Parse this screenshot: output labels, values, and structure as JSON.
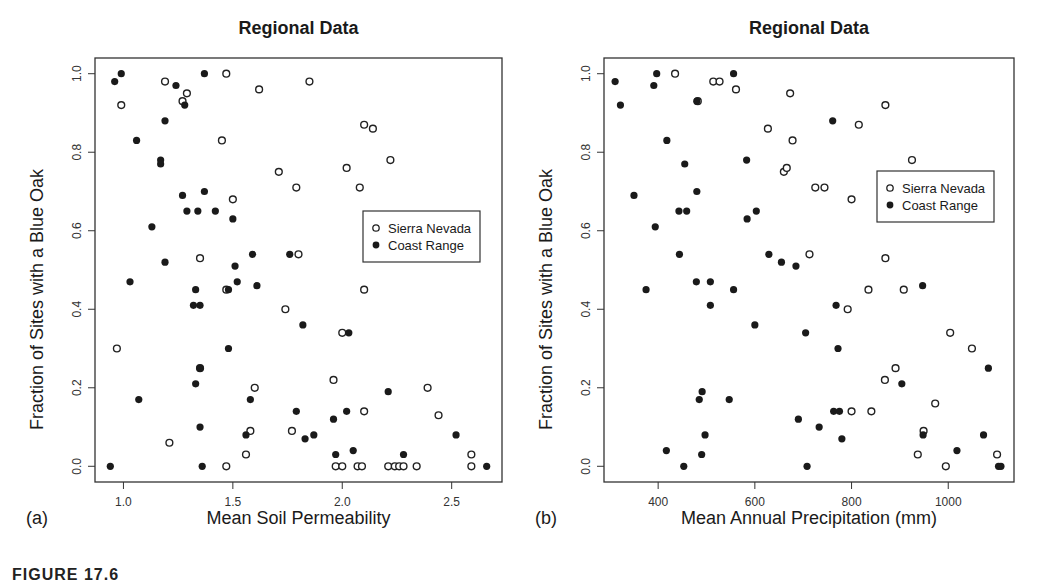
{
  "figure": {
    "caption": "FIGURE 17.6"
  },
  "legend": {
    "series": [
      {
        "name": "Sierra Nevada",
        "marker": "open-circle"
      },
      {
        "name": "Coast Range",
        "marker": "filled-circle"
      }
    ]
  },
  "panels": [
    {
      "label": "(a)",
      "title": "Regional Data",
      "xlabel": "Mean Soil Permeability",
      "ylabel": "Fraction of Sites with a Blue Oak"
    },
    {
      "label": "(b)",
      "title": "Regional Data",
      "xlabel": "Mean Annual Precipitation (mm)",
      "ylabel": "Fraction of Sites with a Blue Oak"
    }
  ],
  "chart_data": [
    {
      "type": "scatter",
      "title": "Regional Data",
      "xlabel": "Mean Soil Permeability",
      "ylabel": "Fraction of Sites with a Blue Oak",
      "panel_label": "(a)",
      "xlim": [
        0.87,
        2.73
      ],
      "ylim": [
        -0.04,
        1.04
      ],
      "xticks": [
        1.0,
        1.5,
        2.0,
        2.5
      ],
      "yticks": [
        0.0,
        0.2,
        0.4,
        0.6,
        0.8,
        1.0
      ],
      "xtick_labels": [
        "1.0",
        "1.5",
        "2.0",
        "2.5"
      ],
      "ytick_labels": [
        "0.0",
        "0.2",
        "0.4",
        "0.6",
        "0.8",
        "1.0"
      ],
      "grid": false,
      "legend_position": "right-middle",
      "series": [
        {
          "name": "Sierra Nevada",
          "marker": "open",
          "points": [
            [
              0.99,
              0.92
            ],
            [
              1.19,
              0.98
            ],
            [
              1.27,
              0.93
            ],
            [
              1.29,
              0.95
            ],
            [
              1.47,
              1.0
            ],
            [
              1.45,
              0.83
            ],
            [
              1.62,
              0.96
            ],
            [
              1.85,
              0.98
            ],
            [
              2.1,
              0.87
            ],
            [
              2.14,
              0.86
            ],
            [
              2.22,
              0.78
            ],
            [
              1.71,
              0.75
            ],
            [
              1.79,
              0.71
            ],
            [
              2.02,
              0.76
            ],
            [
              2.08,
              0.71
            ],
            [
              1.5,
              0.68
            ],
            [
              1.35,
              0.53
            ],
            [
              1.8,
              0.54
            ],
            [
              1.47,
              0.45
            ],
            [
              2.1,
              0.45
            ],
            [
              1.74,
              0.4
            ],
            [
              2.0,
              0.34
            ],
            [
              0.97,
              0.3
            ],
            [
              1.96,
              0.22
            ],
            [
              1.6,
              0.2
            ],
            [
              2.39,
              0.2
            ],
            [
              2.1,
              0.14
            ],
            [
              2.44,
              0.13
            ],
            [
              1.35,
              0.25
            ],
            [
              1.58,
              0.09
            ],
            [
              1.77,
              0.09
            ],
            [
              1.21,
              0.06
            ],
            [
              1.56,
              0.03
            ],
            [
              2.59,
              0.03
            ],
            [
              1.47,
              0.0
            ],
            [
              1.97,
              0.0
            ],
            [
              2.0,
              0.0
            ],
            [
              2.07,
              0.0
            ],
            [
              2.09,
              0.0
            ],
            [
              2.21,
              0.0
            ],
            [
              2.24,
              0.0
            ],
            [
              2.26,
              0.0
            ],
            [
              2.28,
              0.0
            ],
            [
              2.34,
              0.0
            ],
            [
              2.59,
              0.0
            ]
          ]
        },
        {
          "name": "Coast Range",
          "marker": "filled",
          "points": [
            [
              0.96,
              0.98
            ],
            [
              0.99,
              1.0
            ],
            [
              1.37,
              1.0
            ],
            [
              1.24,
              0.97
            ],
            [
              1.28,
              0.92
            ],
            [
              1.19,
              0.88
            ],
            [
              1.06,
              0.83
            ],
            [
              1.17,
              0.78
            ],
            [
              1.17,
              0.77
            ],
            [
              1.37,
              0.7
            ],
            [
              1.27,
              0.69
            ],
            [
              1.29,
              0.65
            ],
            [
              1.34,
              0.65
            ],
            [
              1.42,
              0.65
            ],
            [
              1.5,
              0.63
            ],
            [
              1.13,
              0.61
            ],
            [
              1.59,
              0.54
            ],
            [
              1.76,
              0.54
            ],
            [
              1.19,
              0.52
            ],
            [
              1.51,
              0.51
            ],
            [
              1.03,
              0.47
            ],
            [
              1.52,
              0.47
            ],
            [
              1.61,
              0.46
            ],
            [
              1.33,
              0.45
            ],
            [
              1.48,
              0.45
            ],
            [
              1.32,
              0.41
            ],
            [
              1.35,
              0.41
            ],
            [
              1.82,
              0.36
            ],
            [
              2.03,
              0.34
            ],
            [
              1.48,
              0.3
            ],
            [
              1.35,
              0.25
            ],
            [
              1.33,
              0.21
            ],
            [
              1.07,
              0.17
            ],
            [
              1.58,
              0.17
            ],
            [
              2.21,
              0.19
            ],
            [
              1.79,
              0.14
            ],
            [
              2.02,
              0.14
            ],
            [
              1.96,
              0.12
            ],
            [
              1.35,
              0.1
            ],
            [
              1.56,
              0.08
            ],
            [
              1.83,
              0.07
            ],
            [
              1.87,
              0.08
            ],
            [
              2.52,
              0.08
            ],
            [
              1.97,
              0.03
            ],
            [
              2.05,
              0.04
            ],
            [
              2.28,
              0.03
            ],
            [
              0.94,
              0.0
            ],
            [
              1.36,
              0.0
            ],
            [
              2.66,
              0.0
            ]
          ]
        }
      ]
    },
    {
      "type": "scatter",
      "title": "Regional Data",
      "xlabel": "Mean Annual Precipitation (mm)",
      "ylabel": "Fraction of Sites with a Blue Oak",
      "panel_label": "(b)",
      "xlim": [
        288,
        1136
      ],
      "ylim": [
        -0.04,
        1.04
      ],
      "xticks": [
        400,
        600,
        800,
        1000
      ],
      "yticks": [
        0.0,
        0.2,
        0.4,
        0.6,
        0.8,
        1.0
      ],
      "xtick_labels": [
        "400",
        "600",
        "800",
        "1000"
      ],
      "ytick_labels": [
        "0.0",
        "0.2",
        "0.4",
        "0.6",
        "0.8",
        "1.0"
      ],
      "grid": false,
      "legend_position": "right-middle",
      "series": [
        {
          "name": "Sierra Nevada",
          "marker": "open",
          "points": [
            [
              435,
              1.0
            ],
            [
              514,
              0.98
            ],
            [
              527,
              0.98
            ],
            [
              561,
              0.96
            ],
            [
              482,
              0.93
            ],
            [
              673,
              0.95
            ],
            [
              870,
              0.92
            ],
            [
              627,
              0.86
            ],
            [
              815,
              0.87
            ],
            [
              678,
              0.83
            ],
            [
              660,
              0.75
            ],
            [
              666,
              0.76
            ],
            [
              725,
              0.71
            ],
            [
              744,
              0.71
            ],
            [
              800,
              0.68
            ],
            [
              925,
              0.78
            ],
            [
              713,
              0.54
            ],
            [
              870,
              0.53
            ],
            [
              835,
              0.45
            ],
            [
              908,
              0.45
            ],
            [
              792,
              0.4
            ],
            [
              1004,
              0.34
            ],
            [
              1049,
              0.3
            ],
            [
              891,
              0.25
            ],
            [
              869,
              0.22
            ],
            [
              973,
              0.16
            ],
            [
              800,
              0.14
            ],
            [
              841,
              0.14
            ],
            [
              949,
              0.09
            ],
            [
              937,
              0.03
            ],
            [
              995,
              0.0
            ],
            [
              1101,
              0.03
            ]
          ]
        },
        {
          "name": "Coast Range",
          "marker": "filled",
          "points": [
            [
              311,
              0.98
            ],
            [
              322,
              0.92
            ],
            [
              391,
              0.97
            ],
            [
              397,
              1.0
            ],
            [
              556,
              1.0
            ],
            [
              480,
              0.93
            ],
            [
              418,
              0.83
            ],
            [
              761,
              0.88
            ],
            [
              583,
              0.78
            ],
            [
              455,
              0.77
            ],
            [
              480,
              0.7
            ],
            [
              350,
              0.69
            ],
            [
              443,
              0.65
            ],
            [
              459,
              0.65
            ],
            [
              603,
              0.65
            ],
            [
              584,
              0.63
            ],
            [
              394,
              0.61
            ],
            [
              629,
              0.54
            ],
            [
              444,
              0.54
            ],
            [
              655,
              0.52
            ],
            [
              685,
              0.51
            ],
            [
              479,
              0.47
            ],
            [
              508,
              0.47
            ],
            [
              947,
              0.46
            ],
            [
              375,
              0.45
            ],
            [
              556,
              0.45
            ],
            [
              768,
              0.41
            ],
            [
              508,
              0.41
            ],
            [
              600,
              0.36
            ],
            [
              705,
              0.34
            ],
            [
              772,
              0.3
            ],
            [
              1083,
              0.25
            ],
            [
              904,
              0.21
            ],
            [
              491,
              0.19
            ],
            [
              485,
              0.17
            ],
            [
              547,
              0.17
            ],
            [
              763,
              0.14
            ],
            [
              775,
              0.14
            ],
            [
              690,
              0.12
            ],
            [
              733,
              0.1
            ],
            [
              497,
              0.08
            ],
            [
              948,
              0.08
            ],
            [
              1073,
              0.08
            ],
            [
              780,
              0.07
            ],
            [
              417,
              0.04
            ],
            [
              490,
              0.03
            ],
            [
              1018,
              0.04
            ],
            [
              453,
              0.0
            ],
            [
              708,
              0.0
            ],
            [
              1104,
              0.0
            ],
            [
              1109,
              0.0
            ]
          ]
        }
      ]
    }
  ]
}
